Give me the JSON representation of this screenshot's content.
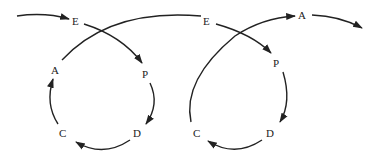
{
  "diagram": {
    "type": "linked-cycles",
    "cycles": [
      {
        "name": "cycle-1",
        "nodes": [
          {
            "id": "E1",
            "label": "E"
          },
          {
            "id": "P1",
            "label": "P"
          },
          {
            "id": "D1",
            "label": "D"
          },
          {
            "id": "C1",
            "label": "C"
          },
          {
            "id": "A1",
            "label": "A"
          }
        ]
      },
      {
        "name": "cycle-2",
        "nodes": [
          {
            "id": "E2",
            "label": "E"
          },
          {
            "id": "P2",
            "label": "P"
          },
          {
            "id": "D2",
            "label": "D"
          },
          {
            "id": "C2",
            "label": "C"
          },
          {
            "id": "A2",
            "label": "A"
          }
        ]
      }
    ],
    "edges": [
      [
        "start",
        "E1"
      ],
      [
        "E1",
        "P1"
      ],
      [
        "P1",
        "D1"
      ],
      [
        "D1",
        "C1"
      ],
      [
        "C1",
        "A1"
      ],
      [
        "A1",
        "E2"
      ],
      [
        "E2",
        "P2"
      ],
      [
        "P2",
        "D2"
      ],
      [
        "D2",
        "C2"
      ],
      [
        "C2",
        "A2"
      ],
      [
        "A2",
        "end"
      ]
    ]
  },
  "labels": {
    "e1": "E",
    "p1": "P",
    "d1": "D",
    "c1": "C",
    "a1": "A",
    "e2": "E",
    "p2": "P",
    "d2": "D",
    "c2": "C",
    "a2": "A"
  }
}
